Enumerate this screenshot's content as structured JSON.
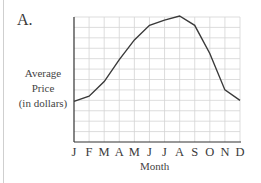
{
  "panel": {
    "label": "A."
  },
  "chart_data": {
    "type": "line",
    "title": "A.",
    "xlabel": "Month",
    "ylabel": "Average Price (in dollars)",
    "ylabel_lines": [
      "Average",
      "Price",
      "(in dollars)"
    ],
    "categories": [
      "J",
      "F",
      "M",
      "A",
      "M",
      "J",
      "J",
      "A",
      "S",
      "O",
      "N",
      "D"
    ],
    "series": [
      {
        "name": "Average Price",
        "values": [
          3.9,
          4.4,
          5.8,
          7.9,
          9.8,
          11.2,
          11.7,
          12.1,
          11.2,
          8.5,
          5.0,
          4.0
        ]
      }
    ],
    "ylim": [
      0,
      12
    ],
    "y_tick_labels": [],
    "grid": true,
    "legend": null,
    "line_color": "#3a3a3a",
    "grid_color": "#d4d4d4",
    "axis_color": "#333333"
  }
}
